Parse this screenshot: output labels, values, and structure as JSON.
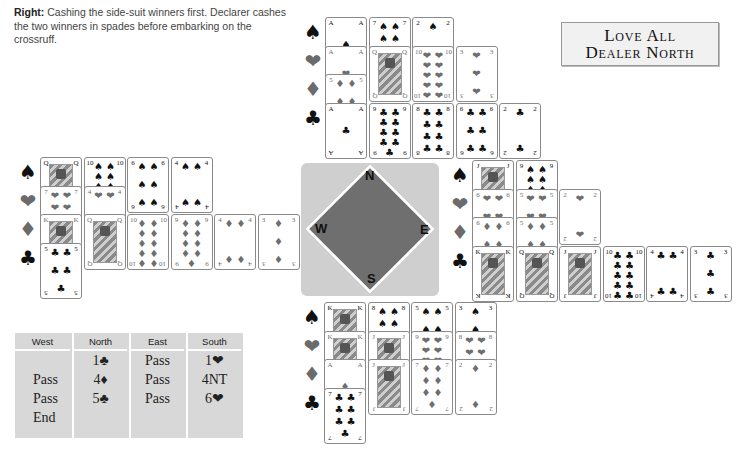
{
  "caption": {
    "bold": "Right:",
    "text": " Cashing the side-suit winners first. Declarer cashes the two winners in spades before embarking on the crossruff."
  },
  "vulnerability": {
    "line1": "Love All",
    "line2": "Dealer North"
  },
  "suit_symbols": {
    "spades": "♠",
    "hearts": "❤",
    "diamonds": "♦",
    "clubs": "♣"
  },
  "hands": {
    "north": {
      "spades": [
        "A",
        "7",
        "2"
      ],
      "hearts": [
        "A",
        "Q",
        "10",
        "3"
      ],
      "diamonds": [
        "5"
      ],
      "clubs": [
        "A",
        "9",
        "8",
        "6",
        "2"
      ]
    },
    "west": {
      "spades": [
        "Q",
        "10",
        "6",
        "4"
      ],
      "hearts": [
        "7",
        "4"
      ],
      "diamonds": [
        "K",
        "Q",
        "10",
        "9",
        "4",
        "3"
      ],
      "clubs": [
        "5"
      ]
    },
    "east": {
      "spades": [
        "J",
        "9"
      ],
      "hearts": [
        "6",
        "5",
        "2"
      ],
      "diamonds": [
        "6",
        "5"
      ],
      "clubs": [
        "K",
        "Q",
        "J",
        "10",
        "4",
        "3"
      ]
    },
    "south": {
      "spades": [
        "K",
        "8",
        "5",
        "3"
      ],
      "hearts": [
        "K",
        "J",
        "9",
        "8"
      ],
      "diamonds": [
        "A",
        "J",
        "7",
        "2"
      ],
      "clubs": [
        "7"
      ]
    }
  },
  "compass": {
    "north": "N",
    "west": "W",
    "east": "E",
    "south": "S"
  },
  "auction": {
    "headers": [
      "West",
      "North",
      "East",
      "South"
    ],
    "columns": {
      "west": [
        "",
        "Pass",
        "Pass",
        "End"
      ],
      "north": [
        "1♣",
        "4♦",
        "5♣",
        ""
      ],
      "east": [
        "Pass",
        "Pass",
        "Pass",
        ""
      ],
      "south": [
        "1❤",
        "4NT",
        "6❤",
        ""
      ]
    }
  },
  "colors": {
    "black_suit": "#111111",
    "red_suit_grey": "#6e6e6e",
    "compass_bg": "#cfcfcf",
    "compass_diamond": "#6f6f6f",
    "auction_bg": "#d8d8d8"
  }
}
